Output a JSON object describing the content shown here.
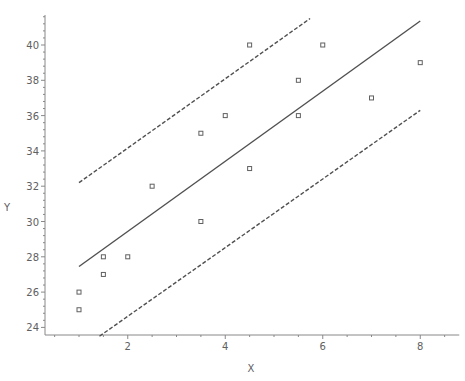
{
  "chart_data": {
    "type": "scatter",
    "title": "",
    "xlabel": "X",
    "ylabel": "Y",
    "xlim": [
      0.3,
      8.8
    ],
    "ylim": [
      23.5,
      41.7
    ],
    "x_ticks": [
      2,
      4,
      6,
      8
    ],
    "y_ticks": [
      24,
      26,
      28,
      30,
      32,
      34,
      36,
      38,
      40
    ],
    "grid": false,
    "legend": null,
    "series": [
      {
        "name": "Observations",
        "kind": "scatter",
        "marker": "open-square",
        "color": "#606060",
        "points": [
          {
            "x": 1,
            "y": 26
          },
          {
            "x": 1,
            "y": 25
          },
          {
            "x": 1.5,
            "y": 28
          },
          {
            "x": 1.5,
            "y": 27
          },
          {
            "x": 2,
            "y": 28
          },
          {
            "x": 2.5,
            "y": 32
          },
          {
            "x": 3.5,
            "y": 35
          },
          {
            "x": 3.5,
            "y": 30
          },
          {
            "x": 4,
            "y": 36
          },
          {
            "x": 4.5,
            "y": 40
          },
          {
            "x": 4.5,
            "y": 33
          },
          {
            "x": 5.5,
            "y": 38
          },
          {
            "x": 5.5,
            "y": 36
          },
          {
            "x": 6,
            "y": 40
          },
          {
            "x": 7,
            "y": 37
          },
          {
            "x": 8,
            "y": 39
          }
        ]
      },
      {
        "name": "Regression line",
        "kind": "line",
        "style": "solid",
        "color": "#505050",
        "points": [
          {
            "x": 1,
            "y": 27.45
          },
          {
            "x": 8,
            "y": 41.36
          }
        ]
      },
      {
        "name": "Upper prediction limit",
        "kind": "line",
        "style": "dashed",
        "color": "#505050",
        "points": [
          {
            "x": 1,
            "y": 32.2
          },
          {
            "x": 5.74,
            "y": 41.5
          }
        ]
      },
      {
        "name": "Lower prediction limit",
        "kind": "line",
        "style": "dashed",
        "color": "#505050",
        "points": [
          {
            "x": 1.42,
            "y": 23.5
          },
          {
            "x": 8,
            "y": 36.3
          }
        ]
      }
    ]
  }
}
